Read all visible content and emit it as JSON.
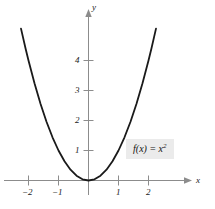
{
  "figure": {
    "background_color": "#ffffff",
    "axis_color": "#8c8c8c",
    "curve_color": "#1a1a1a",
    "label_box_color": "#ebebeb"
  },
  "equation": {
    "fn": "f",
    "open_paren": "(",
    "variable": "x",
    "close_paren": ")",
    "equals": "=",
    "rhs_base": "x",
    "rhs_exponent": "2",
    "full_text": "f(x) = x²"
  },
  "axes": {
    "x_name": "x",
    "y_name": "y",
    "x_ticks": [
      "−2",
      "−1",
      "1",
      "2"
    ],
    "y_ticks": [
      "1",
      "2",
      "3",
      "4"
    ]
  },
  "chart_data": {
    "type": "line",
    "title": "",
    "subtitle": "",
    "xlabel": "x",
    "ylabel": "y",
    "xlim": [
      -2.45,
      2.45
    ],
    "ylim": [
      -0.35,
      5.1
    ],
    "xticks": [
      -2,
      -1,
      1,
      2
    ],
    "yticks": [
      1,
      2,
      3,
      4
    ],
    "xticklabels": [
      "−2",
      "−1",
      "1",
      "2"
    ],
    "yticklabels": [
      "1",
      "2",
      "3",
      "4"
    ],
    "grid": false,
    "legend": false,
    "annotations": [
      {
        "text": "f(x) = x²",
        "x": 1.35,
        "y": 1.25,
        "style": "boxed-italic-serif"
      }
    ],
    "series": [
      {
        "name": "f(x) = x²",
        "equation": "y = x^2",
        "color": "#1a1a1a",
        "linewidth": 1.8,
        "x": [
          -2.25,
          -2.1,
          -2.0,
          -1.8,
          -1.6,
          -1.4,
          -1.2,
          -1.0,
          -0.8,
          -0.6,
          -0.4,
          -0.2,
          0.0,
          0.2,
          0.4,
          0.6,
          0.8,
          1.0,
          1.2,
          1.4,
          1.6,
          1.8,
          2.0,
          2.1,
          2.25
        ],
        "y": [
          5.0625,
          4.41,
          4.0,
          3.24,
          2.56,
          1.96,
          1.44,
          1.0,
          0.64,
          0.36,
          0.16,
          0.04,
          0.0,
          0.04,
          0.16,
          0.36,
          0.64,
          1.0,
          1.44,
          1.96,
          2.56,
          3.24,
          4.0,
          4.41,
          5.0625
        ]
      }
    ]
  }
}
